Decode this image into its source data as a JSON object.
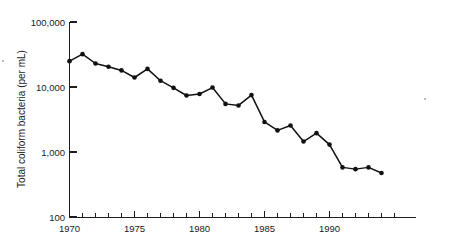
{
  "chart_data": {
    "type": "line",
    "title": "",
    "xlabel": "",
    "ylabel": "Total coliform bacteria (per mL)",
    "yscale": "log",
    "ylim": [
      100,
      100000
    ],
    "xlim": [
      1970,
      1996
    ],
    "grid": false,
    "legend": false,
    "marker": "filled-circle",
    "line_color": "#111111",
    "x": [
      1970,
      1971,
      1972,
      1973,
      1974,
      1975,
      1976,
      1977,
      1978,
      1979,
      1980,
      1981,
      1982,
      1983,
      1984,
      1985,
      1986,
      1987,
      1988,
      1989,
      1990,
      1991,
      1992,
      1993,
      1994
    ],
    "values": [
      25000,
      32000,
      23000,
      20500,
      18000,
      14000,
      19000,
      12500,
      9700,
      7400,
      7800,
      9800,
      5500,
      5200,
      7500,
      2900,
      2150,
      2550,
      1450,
      1950,
      1300,
      580,
      545,
      580,
      475
    ],
    "series": [
      {
        "name": "Total coliform bacteria (per mL)",
        "values": [
          25000,
          32000,
          23000,
          20500,
          18000,
          14000,
          19000,
          12500,
          9700,
          7400,
          7800,
          9800,
          5500,
          5200,
          7500,
          2900,
          2150,
          2550,
          1450,
          1950,
          1300,
          580,
          545,
          580,
          475
        ]
      }
    ],
    "y_tick_labels": [
      "100,000",
      "10,000",
      "1,000",
      "100"
    ],
    "y_tick_values": [
      100000,
      10000,
      1000,
      100
    ],
    "x_tick_labels": [
      "1970",
      "1975",
      "1980",
      "1985",
      "1990"
    ],
    "x_tick_values": [
      1970,
      1975,
      1980,
      1985,
      1990
    ],
    "x_minor_ticks": [
      1971,
      1972,
      1973,
      1974,
      1976,
      1977,
      1978,
      1979,
      1981,
      1982,
      1983,
      1984,
      1986,
      1987,
      1988,
      1989,
      1991,
      1992,
      1993,
      1994,
      1995
    ]
  },
  "axis": {
    "y_title": "Total coliform bacteria (per mL)",
    "y_labels": {
      "t100000": "100,000",
      "t10000": "10,000",
      "t1000": "1,000",
      "t100": "100"
    },
    "x_labels": {
      "t1970": "1970",
      "t1975": "1975",
      "t1980": "1980",
      "t1985": "1985",
      "t1990": "1990"
    }
  }
}
